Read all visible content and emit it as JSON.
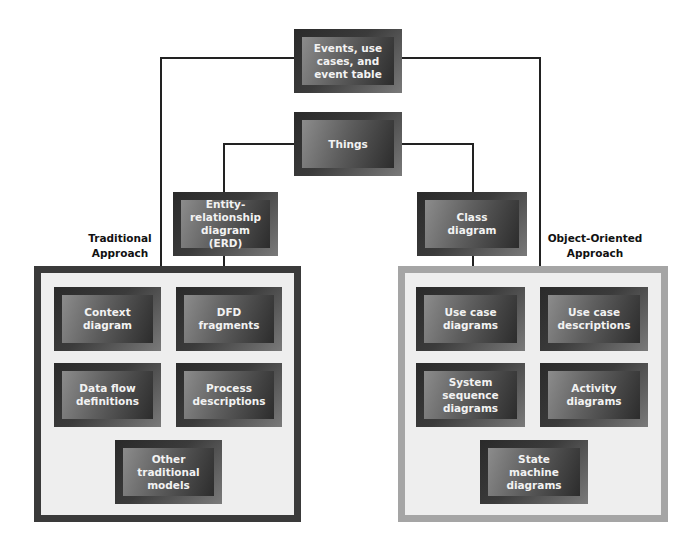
{
  "diagram": {
    "top_nodes": {
      "events": "Events, use\ncases, and\nevent table",
      "things": "Things"
    },
    "traditional": {
      "label": "Traditional\nApproach",
      "bridge_node": "Entity-\nrelationship\ndiagram (ERD)",
      "container_border_color": "#3a3a3a",
      "models": [
        "Context\ndiagram",
        "DFD fragments",
        "Data flow\ndefinitions",
        "Process\ndescriptions",
        "Other\ntraditional\nmodels"
      ]
    },
    "object_oriented": {
      "label": "Object-Oriented\nApproach",
      "bridge_node": "Class\ndiagram",
      "container_border_color": "#a5a5a5",
      "models": [
        "Use case\ndiagrams",
        "Use case\ndescriptions",
        "System\nsequence\ndiagrams",
        "Activity\ndiagrams",
        "State machine\ndiagrams"
      ]
    }
  }
}
